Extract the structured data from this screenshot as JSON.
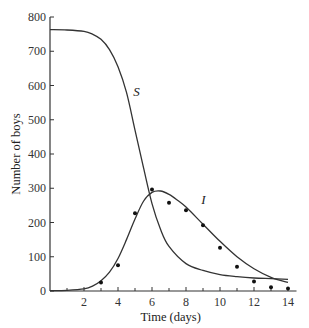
{
  "chart_data": {
    "type": "line",
    "title": "",
    "xlabel": "Time (days)",
    "ylabel": "Number of boys",
    "xlim": [
      0,
      14.5
    ],
    "ylim": [
      0,
      800
    ],
    "x_ticks": [
      2,
      4,
      6,
      8,
      10,
      12,
      14
    ],
    "x_minor_ticks": [
      1,
      3,
      5,
      7,
      9,
      11,
      13
    ],
    "y_ticks": [
      0,
      100,
      200,
      300,
      400,
      500,
      600,
      700,
      800
    ],
    "grid": false,
    "legend": null,
    "annotations": [
      {
        "text": "S",
        "x": 4.9,
        "y": 570
      },
      {
        "text": "I",
        "x": 8.9,
        "y": 255
      }
    ],
    "series": [
      {
        "name": "S",
        "kind": "curve",
        "x": [
          0,
          1,
          2,
          2.5,
          3,
          3.5,
          4,
          4.5,
          5,
          5.5,
          6,
          6.5,
          7,
          8,
          9,
          10,
          11,
          12,
          13,
          14
        ],
        "y": [
          763,
          762,
          758,
          750,
          735,
          705,
          655,
          580,
          470,
          360,
          255,
          180,
          130,
          80,
          60,
          48,
          42,
          38,
          36,
          34
        ]
      },
      {
        "name": "I",
        "kind": "curve",
        "x": [
          0,
          1,
          2,
          2.5,
          3,
          3.5,
          4,
          4.5,
          5,
          5.5,
          6,
          6.5,
          7,
          7.5,
          8,
          9,
          10,
          11,
          12,
          13,
          14
        ],
        "y": [
          1,
          2,
          6,
          14,
          30,
          55,
          95,
          150,
          210,
          262,
          288,
          292,
          282,
          265,
          245,
          195,
          145,
          100,
          65,
          40,
          25
        ]
      },
      {
        "name": "Observed",
        "kind": "points",
        "x": [
          3,
          4,
          5,
          6,
          7,
          8,
          9,
          10,
          11,
          12,
          13,
          14
        ],
        "y": [
          25,
          75,
          227,
          296,
          258,
          236,
          192,
          126,
          71,
          28,
          11,
          7
        ]
      }
    ]
  }
}
